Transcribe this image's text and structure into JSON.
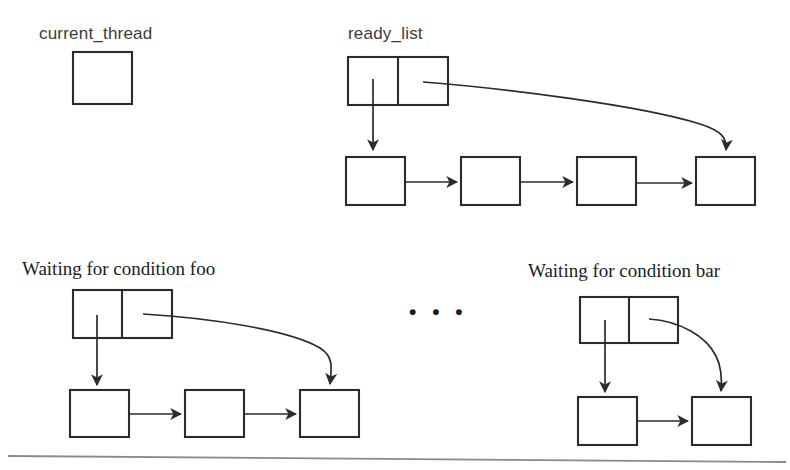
{
  "diagram": {
    "title_labels": {
      "current_thread": "current_thread",
      "ready_list": "ready_list",
      "waiting_foo": "Waiting for condition foo",
      "waiting_bar": "Waiting for condition bar"
    },
    "ellipsis": "• • •",
    "colors": {
      "stroke": "#2b2b2b",
      "label_sans": "#3b3b3b",
      "label_serif": "#1b1b1b",
      "background": "#ffffff",
      "rule": "#8a8a8a"
    },
    "structures": [
      {
        "name": "current_thread",
        "label": "current_thread",
        "label_font": "sans",
        "header_cells": 0,
        "boxes": 1,
        "chain_boxes": 0,
        "has_head_arrow": false,
        "has_tail_arrow": false
      },
      {
        "name": "ready_list",
        "label": "ready_list",
        "label_font": "sans",
        "header_cells": 2,
        "header_cell_labels": [
          "head",
          "tail"
        ],
        "chain_boxes": 4,
        "has_head_arrow": true,
        "has_tail_arrow": true,
        "chain_arrows": 3
      },
      {
        "name": "waiting_foo",
        "label": "Waiting for condition foo",
        "label_font": "serif",
        "header_cells": 2,
        "header_cell_labels": [
          "head",
          "tail"
        ],
        "chain_boxes": 3,
        "has_head_arrow": true,
        "has_tail_arrow": true,
        "chain_arrows": 2
      },
      {
        "name": "waiting_bar",
        "label": "Waiting for condition bar",
        "label_font": "serif",
        "header_cells": 2,
        "header_cell_labels": [
          "head",
          "tail"
        ],
        "chain_boxes": 2,
        "has_head_arrow": true,
        "has_tail_arrow": true,
        "chain_arrows": 1
      }
    ]
  }
}
